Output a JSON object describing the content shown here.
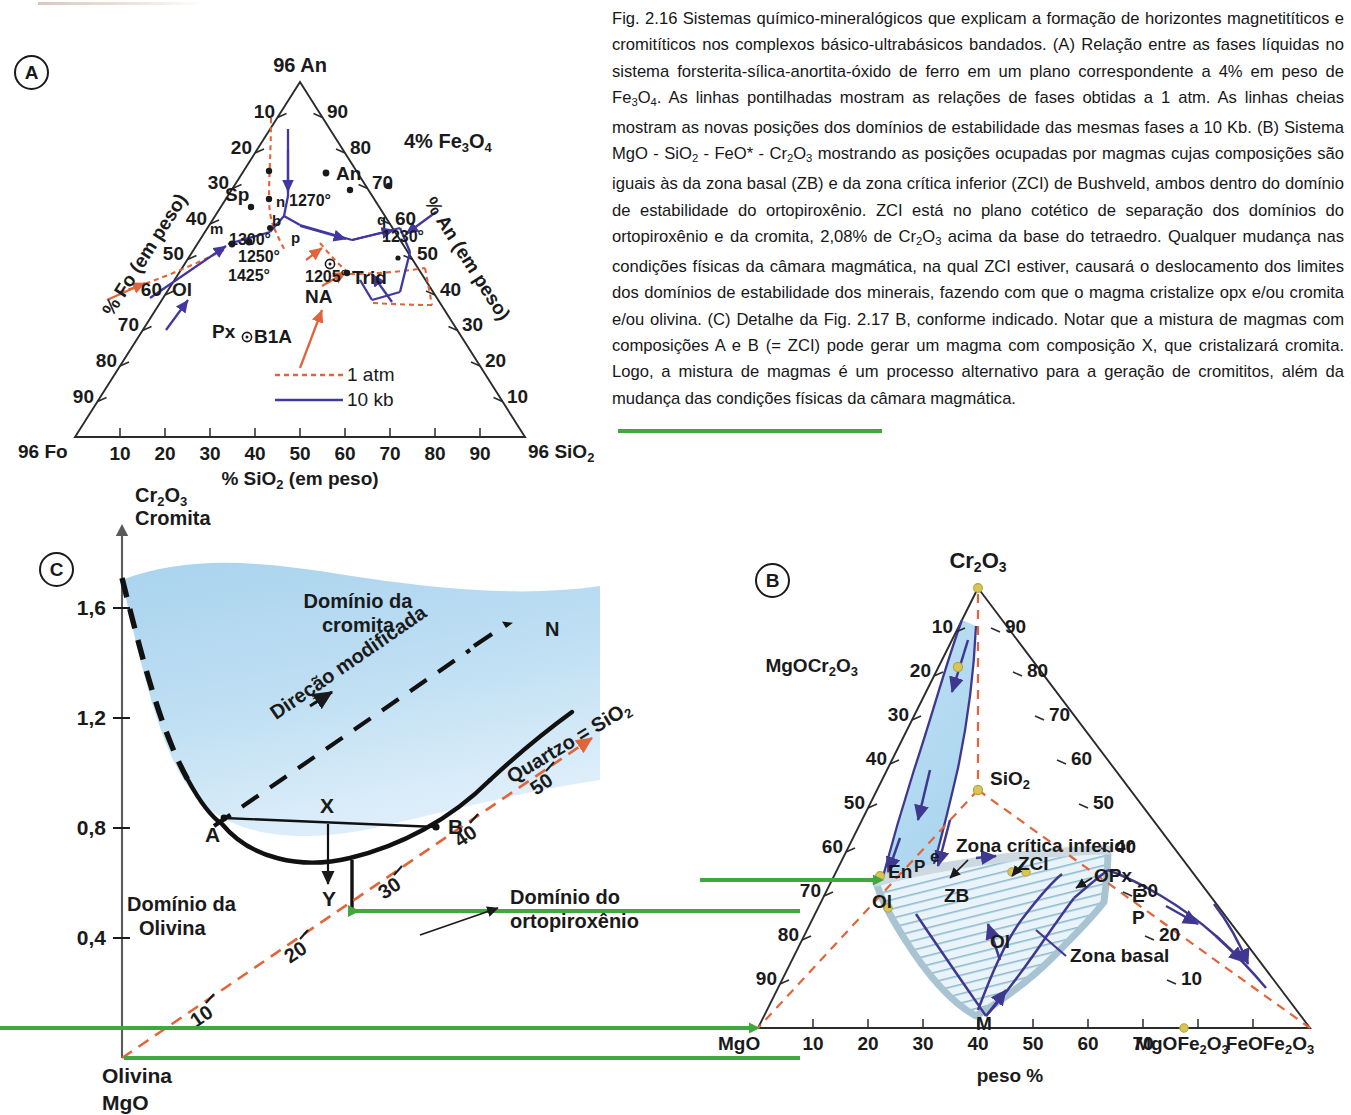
{
  "figure": {
    "caption": "Fig. 2.16 Sistemas químico-mineralógicos que explicam a formação de horizontes magnetitíticos e cromitíticos nos complexos básico-ultrabásicos bandados. (A) Relação entre as fases líquidas no sistema forsterita-sílica-anortita-óxido de ferro em um plano correspondente a 4% em peso de Fe3O4. As linhas pontilhadas mostram as relações de fases obtidas a 1 atm. As linhas cheias mostram as novas posições dos domínios de estabilidade das mesmas fases a 10 Kb. (B) Sistema MgO - SiO2 - FeO* - Cr2O3 mostrando as posições ocupadas por magmas cujas composições são iguais às da zona basal (ZB) e da zona crítica inferior (ZCI) de Bushveld, ambos dentro do domínio de estabilidade do ortopiroxênio. ZCI está no plano cotético de separação dos domínios do ortopiroxênio e da cromita, 2,08% de Cr2O3 acima da base do tetraedro. Qualquer mudança nas condições físicas da câmara magmática, na qual ZCI estiver, causará o deslocamento dos limites dos domínios de estabilidade dos minerais, fazendo com que o magma cristalize opx e/ou cromita e/ou olivina. (C) Detalhe da Fig. 2.17 B, conforme indicado. Notar que a mistura de magmas com composições A e B (= ZCI) pode gerar um magma com composição X, que cristalizará cromita. Logo, a mistura de magmas é um processo alternativo para a geração de cromititos, além da mudança das condições físicas da câmara magmática."
  },
  "colors": {
    "ink": "#1a1a1a",
    "one_atm": "#e2643a",
    "ten_kb": "#4038a0",
    "green_arrow": "#3fa93f",
    "field_fill": "#aed6ef",
    "hatch": "#b9d3e0",
    "dot_yellow": "#d8c556"
  },
  "panel_a": {
    "badge": "A",
    "apex_label": "96 An",
    "corner_left": "96 Fo",
    "corner_right": "96 SiO2",
    "plane_note": "4% Fe3O4",
    "axis_left_label": "% Fo (em peso)",
    "axis_right_label": "% An (em peso)",
    "axis_bottom_label": "% SiO2 (em peso)",
    "ticks_left": [
      "10",
      "20",
      "30",
      "40",
      "50",
      "60",
      "70",
      "80",
      "90"
    ],
    "ticks_right": [
      "90",
      "80",
      "70",
      "60",
      "50",
      "40",
      "30",
      "20",
      "10"
    ],
    "ticks_bottom": [
      "10",
      "20",
      "30",
      "40",
      "50",
      "60",
      "70",
      "80",
      "90"
    ],
    "interior_labels": [
      "Sp",
      "An",
      "n",
      "1270°",
      "b",
      "m",
      "1300°",
      "p",
      "1250°",
      "1425°",
      "Ol",
      "Px",
      "1205°",
      "NA",
      "Trid",
      "q",
      "1230°",
      "B1A"
    ],
    "legend": [
      {
        "label": "1 atm",
        "style": "dashed",
        "color": "#e2643a"
      },
      {
        "label": "10 kb",
        "style": "solid",
        "color": "#4038a0"
      }
    ]
  },
  "panel_b": {
    "badge": "B",
    "apex_label": "Cr2O3",
    "corner_left": "MgO",
    "corner_right": "FeOFe2O3",
    "axis_bottom_label": "peso %",
    "ticks_left": [
      "10",
      "20",
      "30",
      "40",
      "50",
      "60",
      "70",
      "80",
      "90"
    ],
    "ticks_right": [
      "90",
      "80",
      "70",
      "60",
      "50",
      "40",
      "30",
      "20",
      "10"
    ],
    "ticks_bottom": [
      "10",
      "20",
      "30",
      "40",
      "50",
      "60",
      "70"
    ],
    "bottom_named_ticks": [
      "MgOFe2O3",
      "FeOFe2O3"
    ],
    "point_labels": [
      "MgOCr2O3",
      "SiO2",
      "En",
      "P",
      "e",
      "Ol",
      "ZB",
      "ZCI",
      "OPx",
      "E",
      "P",
      "M",
      "Ol"
    ],
    "annotations": [
      "Zona crítica inferior",
      "Zona basal"
    ]
  },
  "panel_c": {
    "badge": "C",
    "y_axis_label_line1": "Cr2O3",
    "y_axis_label_line2": "Cromita",
    "y_ticks": [
      "1,6",
      "1,2",
      "0,8",
      "0,4"
    ],
    "origin_label_line1": "Olivina",
    "origin_label_line2": "MgO",
    "right_origin_label": "MgO",
    "fields": [
      "Domínio da cromita",
      "Domínio da Olivina",
      "Domínio do ortopiroxênio"
    ],
    "arrow_label": "Direção modificada",
    "quartz_label": "Quartzo = SiO2",
    "point_labels": [
      "A",
      "X",
      "Y",
      "B",
      "N"
    ],
    "scale_ticks": [
      "10",
      "20",
      "30",
      "40",
      "50"
    ]
  }
}
